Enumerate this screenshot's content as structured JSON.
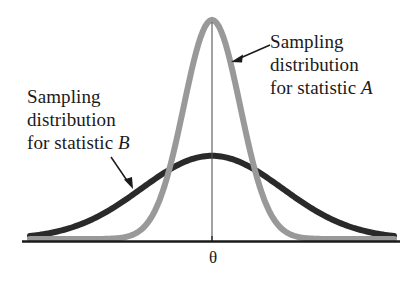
{
  "figure": {
    "background_color": "#ffffff",
    "width": 420,
    "height": 290
  },
  "annotations": {
    "statistic_a": {
      "line1": "Sampling",
      "line2": "distribution",
      "line3_prefix": "for statistic ",
      "line3_symbol": "A",
      "points_to": "statistic-a-curve"
    },
    "statistic_b": {
      "line1": "Sampling",
      "line2": "distribution",
      "line3_prefix": "for statistic ",
      "line3_symbol": "B",
      "points_to": "statistic-b-curve"
    }
  },
  "axis": {
    "tick_label": "θ",
    "baseline_color": "#1a1a1a",
    "center_line_color": "#555555"
  },
  "chart_data": {
    "type": "line",
    "title": "",
    "xlabel": "",
    "ylabel": "",
    "grid": false,
    "legend": "annotations",
    "xlim": [
      -4,
      4
    ],
    "ylim": [
      0,
      1
    ],
    "annotations": [
      "Sampling distribution for statistic A",
      "Sampling distribution for statistic B"
    ],
    "tick_labels": {
      "x": [
        "θ"
      ],
      "y": []
    },
    "series": [
      {
        "name": "Sampling distribution for statistic A",
        "label": "A",
        "color": "#999999",
        "line_width": 6,
        "description": "Narrow, tall normal curve centered at theta; low variance estimator",
        "mean": 0,
        "sd": 0.62,
        "peak_height": 1.0,
        "x": [
          -2.0,
          -1.75,
          -1.5,
          -1.25,
          -1.0,
          -0.75,
          -0.5,
          -0.25,
          0,
          0.25,
          0.5,
          0.75,
          1.0,
          1.25,
          1.5,
          1.75,
          2.0
        ],
        "values": [
          0.006,
          0.02,
          0.054,
          0.13,
          0.277,
          0.48,
          0.72,
          0.922,
          1.0,
          0.922,
          0.72,
          0.48,
          0.277,
          0.13,
          0.054,
          0.02,
          0.006
        ]
      },
      {
        "name": "Sampling distribution for statistic B",
        "label": "B",
        "color": "#2a2a2a",
        "line_width": 6,
        "description": "Wide, flat normal curve centered at theta; high variance estimator",
        "mean": 0,
        "sd": 1.55,
        "peak_height": 0.38,
        "x": [
          -4.0,
          -3.5,
          -3.0,
          -2.5,
          -2.0,
          -1.5,
          -1.0,
          -0.5,
          0,
          0.5,
          1.0,
          1.5,
          2.0,
          2.5,
          3.0,
          3.5,
          4.0
        ],
        "values": [
          0.0046,
          0.0147,
          0.0385,
          0.0862,
          0.166,
          0.266,
          0.333,
          0.368,
          0.38,
          0.368,
          0.333,
          0.266,
          0.166,
          0.0862,
          0.0385,
          0.0147,
          0.0046
        ]
      }
    ]
  }
}
